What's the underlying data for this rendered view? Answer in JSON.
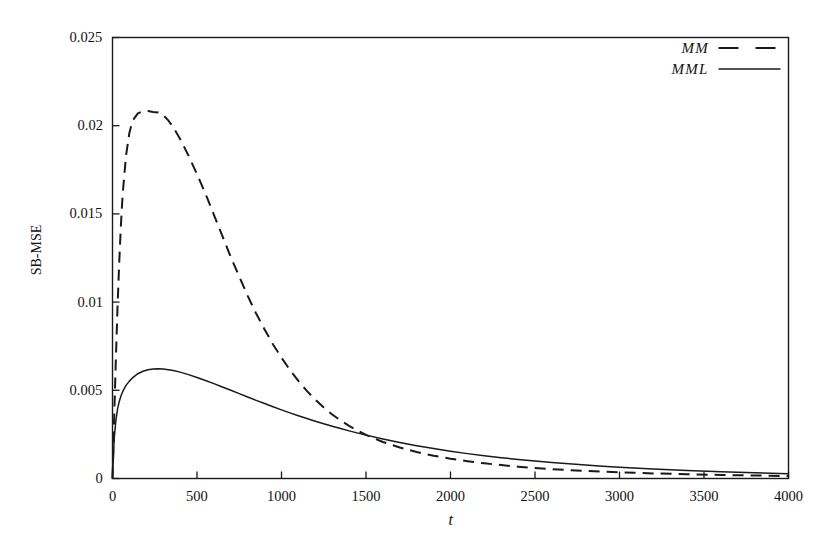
{
  "chart_data": {
    "type": "line",
    "title": "",
    "xlabel": "t",
    "ylabel": "SB-MSE",
    "xlim": [
      0,
      4000
    ],
    "ylim": [
      0,
      0.025
    ],
    "grid": false,
    "legend_position": "top-right-inside",
    "xticks": [
      0,
      500,
      1000,
      1500,
      2000,
      2500,
      3000,
      3500,
      4000
    ],
    "xtick_labels": [
      "0",
      "500",
      "1000",
      "1500",
      "2000",
      "2500",
      "3000",
      "3500",
      "4000"
    ],
    "yticks": [
      0,
      0.005,
      0.01,
      0.015,
      0.02,
      0.025
    ],
    "ytick_labels": [
      "0",
      "0.005",
      "0.01",
      "0.015",
      "0.02",
      "0.025"
    ],
    "series": [
      {
        "name": "MM",
        "style": "dashed",
        "color": "#1a1a1a",
        "x": [
          0,
          10,
          20,
          30,
          40,
          50,
          60,
          80,
          100,
          120,
          150,
          180,
          210,
          240,
          270,
          300,
          330,
          360,
          400,
          450,
          500,
          550,
          600,
          650,
          700,
          750,
          800,
          850,
          900,
          950,
          1000,
          1050,
          1100,
          1150,
          1200,
          1250,
          1300,
          1350,
          1400,
          1500,
          1600,
          1700,
          1800,
          1900,
          2000,
          2100,
          2200,
          2300,
          2400,
          2500,
          2600,
          2700,
          2800,
          2900,
          3000,
          3200,
          3400,
          3600,
          3800,
          4000
        ],
        "y": [
          0.0,
          0.0035,
          0.0068,
          0.0098,
          0.0123,
          0.0144,
          0.0161,
          0.0183,
          0.0196,
          0.0203,
          0.0207,
          0.02082,
          0.02083,
          0.02078,
          0.02075,
          0.0206,
          0.0203,
          0.0199,
          0.01925,
          0.0183,
          0.01725,
          0.01615,
          0.01495,
          0.01375,
          0.01255,
          0.01145,
          0.01035,
          0.00935,
          0.00845,
          0.0076,
          0.00685,
          0.00615,
          0.00553,
          0.00497,
          0.00447,
          0.00402,
          0.00363,
          0.00329,
          0.00298,
          0.00247,
          0.00207,
          0.00176,
          0.0015,
          0.00129,
          0.00112,
          0.00098,
          0.00086,
          0.00076,
          0.00067,
          0.0006,
          0.00053,
          0.00048,
          0.00043,
          0.00039,
          0.00035,
          0.00029,
          0.00024,
          0.0002,
          0.00017,
          0.00014
        ]
      },
      {
        "name": "MML",
        "style": "solid",
        "color": "#1a1a1a",
        "x": [
          0,
          10,
          20,
          30,
          40,
          50,
          60,
          80,
          100,
          120,
          150,
          180,
          210,
          240,
          270,
          300,
          330,
          360,
          400,
          450,
          500,
          550,
          600,
          650,
          700,
          750,
          800,
          850,
          900,
          950,
          1000,
          1050,
          1100,
          1150,
          1200,
          1250,
          1300,
          1350,
          1400,
          1500,
          1600,
          1700,
          1800,
          1900,
          2000,
          2100,
          2200,
          2300,
          2400,
          2500,
          2600,
          2700,
          2800,
          2900,
          3000,
          3200,
          3400,
          3600,
          3800,
          4000
        ],
        "y": [
          0.0,
          0.00225,
          0.0033,
          0.00395,
          0.00437,
          0.00468,
          0.00492,
          0.00528,
          0.00552,
          0.00572,
          0.00594,
          0.00608,
          0.00617,
          0.00621,
          0.00622,
          0.00621,
          0.00617,
          0.00612,
          0.00603,
          0.00589,
          0.00573,
          0.00556,
          0.00538,
          0.00519,
          0.005,
          0.00481,
          0.00462,
          0.00443,
          0.00425,
          0.00407,
          0.00389,
          0.00372,
          0.00356,
          0.0034,
          0.00325,
          0.0031,
          0.00296,
          0.00283,
          0.0027,
          0.00246,
          0.00224,
          0.00204,
          0.00186,
          0.0017,
          0.00155,
          0.00141,
          0.00129,
          0.00118,
          0.00108,
          0.00099,
          0.00091,
          0.00083,
          0.00076,
          0.0007,
          0.00064,
          0.00054,
          0.00045,
          0.00038,
          0.00032,
          0.00027
        ]
      }
    ]
  },
  "axes": {
    "ylabel": "SB-MSE",
    "xlabel": "t"
  },
  "legend": {
    "items": [
      {
        "label": "MM",
        "style": "dashed"
      },
      {
        "label": "MML",
        "style": "solid"
      }
    ]
  },
  "colors": {
    "background": "#ffffff",
    "frame": "#1a1a1a",
    "line": "#1a1a1a",
    "text": "#111111"
  }
}
